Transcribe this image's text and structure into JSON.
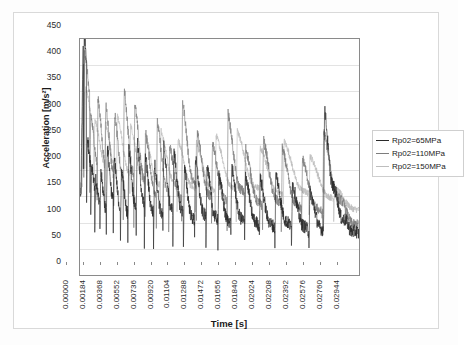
{
  "chart_data": {
    "type": "line",
    "title": "",
    "xlabel": "Time [s]",
    "ylabel": "Acceleration [m/s²]",
    "xlim": [
      0.0,
      0.03036
    ],
    "ylim": [
      0,
      450
    ],
    "grid": "horizontal",
    "legend_position": "right",
    "ytick_labels": [
      "450",
      "400",
      "350",
      "300",
      "250",
      "200",
      "150",
      "100",
      "50",
      "0"
    ],
    "ytick_values": [
      450,
      400,
      350,
      300,
      250,
      200,
      150,
      100,
      50,
      0
    ],
    "xtick_labels": [
      "0.00000",
      "0.00184",
      "0.00368",
      "0.00552",
      "0.00736",
      "0.00920",
      "0.01104",
      "0.01288",
      "0.01472",
      "0.01656",
      "0.01840",
      "0.02024",
      "0.02208",
      "0.02392",
      "0.02576",
      "0.02760",
      "0.02944"
    ],
    "xtick_values": [
      0.0,
      0.00184,
      0.00368,
      0.00552,
      0.00736,
      0.0092,
      0.01104,
      0.01288,
      0.01472,
      0.01656,
      0.0184,
      0.02024,
      0.02208,
      0.02392,
      0.02576,
      0.0276,
      0.02944
    ],
    "series": [
      {
        "name": "Rp02=65MPa",
        "color": "#2a2a2a",
        "impacts": [
          {
            "t": 0.00035,
            "peak": 448,
            "decay": 0.0012,
            "base": 150
          },
          {
            "t": 0.0007,
            "peak": 250,
            "decay": 0.00095,
            "base": 120
          },
          {
            "t": 0.00115,
            "peak": 205,
            "decay": 0.00085,
            "base": 95
          },
          {
            "t": 0.0016,
            "peak": 175,
            "decay": 0.0008,
            "base": 80
          },
          {
            "t": 0.00215,
            "peak": 188,
            "decay": 0.00085,
            "base": 70
          },
          {
            "t": 0.00285,
            "peak": 236,
            "decay": 0.0009,
            "base": 65
          },
          {
            "t": 0.0036,
            "peak": 214,
            "decay": 0.0009,
            "base": 60
          },
          {
            "t": 0.0044,
            "peak": 196,
            "decay": 0.0009,
            "base": 58
          },
          {
            "t": 0.0052,
            "peak": 232,
            "decay": 0.00095,
            "base": 55
          },
          {
            "t": 0.0061,
            "peak": 247,
            "decay": 0.00095,
            "base": 52
          },
          {
            "t": 0.007,
            "peak": 222,
            "decay": 0.00095,
            "base": 50
          },
          {
            "t": 0.008,
            "peak": 205,
            "decay": 0.001,
            "base": 50
          },
          {
            "t": 0.009,
            "peak": 240,
            "decay": 0.001,
            "base": 48
          },
          {
            "t": 0.0101,
            "peak": 228,
            "decay": 0.00105,
            "base": 48
          },
          {
            "t": 0.01125,
            "peak": 196,
            "decay": 0.00105,
            "base": 46
          },
          {
            "t": 0.01245,
            "peak": 215,
            "decay": 0.0011,
            "base": 46
          },
          {
            "t": 0.0137,
            "peak": 205,
            "decay": 0.0011,
            "base": 45
          },
          {
            "t": 0.015,
            "peak": 190,
            "decay": 0.00115,
            "base": 45
          },
          {
            "t": 0.0164,
            "peak": 200,
            "decay": 0.0012,
            "base": 44
          },
          {
            "t": 0.0179,
            "peak": 186,
            "decay": 0.00125,
            "base": 44
          },
          {
            "t": 0.0195,
            "peak": 178,
            "decay": 0.0013,
            "base": 43
          },
          {
            "t": 0.0212,
            "peak": 188,
            "decay": 0.00135,
            "base": 43
          },
          {
            "t": 0.023,
            "peak": 170,
            "decay": 0.0014,
            "base": 42
          },
          {
            "t": 0.0249,
            "peak": 156,
            "decay": 0.00145,
            "base": 42
          },
          {
            "t": 0.0265,
            "peak": 310,
            "decay": 0.0011,
            "base": 70
          }
        ]
      },
      {
        "name": "Rp02=110MPa",
        "color": "#7d7d7d",
        "impacts": [
          {
            "t": 0.0004,
            "peak": 420,
            "decay": 0.00135,
            "base": 160
          },
          {
            "t": 0.00105,
            "peak": 300,
            "decay": 0.0011,
            "base": 130
          },
          {
            "t": 0.00185,
            "peak": 330,
            "decay": 0.0011,
            "base": 110
          },
          {
            "t": 0.0027,
            "peak": 318,
            "decay": 0.0011,
            "base": 100
          },
          {
            "t": 0.00365,
            "peak": 300,
            "decay": 0.00115,
            "base": 95
          },
          {
            "t": 0.0047,
            "peak": 344,
            "decay": 0.0012,
            "base": 92
          },
          {
            "t": 0.00585,
            "peak": 318,
            "decay": 0.00125,
            "base": 88
          },
          {
            "t": 0.00705,
            "peak": 262,
            "decay": 0.00125,
            "base": 85
          },
          {
            "t": 0.0083,
            "peak": 283,
            "decay": 0.0013,
            "base": 82
          },
          {
            "t": 0.00965,
            "peak": 240,
            "decay": 0.00135,
            "base": 80
          },
          {
            "t": 0.01105,
            "peak": 322,
            "decay": 0.0014,
            "base": 78
          },
          {
            "t": 0.01265,
            "peak": 268,
            "decay": 0.00145,
            "base": 76
          },
          {
            "t": 0.0143,
            "peak": 248,
            "decay": 0.0015,
            "base": 75
          },
          {
            "t": 0.016,
            "peak": 300,
            "decay": 0.00155,
            "base": 74
          },
          {
            "t": 0.0179,
            "peak": 238,
            "decay": 0.0016,
            "base": 72
          },
          {
            "t": 0.01985,
            "peak": 252,
            "decay": 0.00165,
            "base": 70
          },
          {
            "t": 0.0219,
            "peak": 236,
            "decay": 0.0017,
            "base": 70
          },
          {
            "t": 0.0241,
            "peak": 218,
            "decay": 0.00175,
            "base": 68
          },
          {
            "t": 0.0264,
            "peak": 268,
            "decay": 0.0018,
            "base": 68
          }
        ]
      },
      {
        "name": "Rp02=150MPa",
        "color": "#bdbdbd",
        "impacts": [
          {
            "t": 0.0005,
            "peak": 352,
            "decay": 0.00165,
            "base": 170
          },
          {
            "t": 0.0015,
            "peak": 292,
            "decay": 0.0015,
            "base": 145
          },
          {
            "t": 0.00265,
            "peak": 286,
            "decay": 0.0015,
            "base": 130
          },
          {
            "t": 0.00395,
            "peak": 300,
            "decay": 0.00155,
            "base": 122
          },
          {
            "t": 0.0054,
            "peak": 280,
            "decay": 0.0016,
            "base": 118
          },
          {
            "t": 0.007,
            "peak": 262,
            "decay": 0.00165,
            "base": 115
          },
          {
            "t": 0.0087,
            "peak": 270,
            "decay": 0.0017,
            "base": 112
          },
          {
            "t": 0.01055,
            "peak": 255,
            "decay": 0.0018,
            "base": 110
          },
          {
            "t": 0.01255,
            "peak": 248,
            "decay": 0.0019,
            "base": 108
          },
          {
            "t": 0.0147,
            "peak": 262,
            "decay": 0.002,
            "base": 106
          },
          {
            "t": 0.017,
            "peak": 272,
            "decay": 0.0021,
            "base": 105
          },
          {
            "t": 0.0195,
            "peak": 240,
            "decay": 0.0022,
            "base": 104
          },
          {
            "t": 0.0221,
            "peak": 252,
            "decay": 0.0023,
            "base": 102
          },
          {
            "t": 0.0249,
            "peak": 225,
            "decay": 0.0024,
            "base": 100
          },
          {
            "t": 0.0276,
            "peak": 165,
            "decay": 0.0025,
            "base": 100
          }
        ]
      }
    ]
  },
  "legend": {
    "items": [
      {
        "label": "Rp02=65MPa"
      },
      {
        "label": "Rp02=110MPa"
      },
      {
        "label": "Rp02=150MPa"
      }
    ]
  }
}
